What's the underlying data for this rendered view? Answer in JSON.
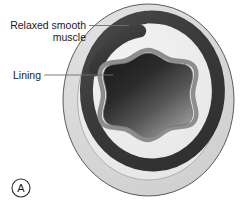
{
  "figure": {
    "panel_label": "A",
    "caption_subject": "relaxed smooth muscle vessel cross-section",
    "labels": [
      {
        "id": "relaxed-smooth-muscle",
        "line1": "Relaxed smooth",
        "line2": "muscle",
        "target": "muscle-ring"
      },
      {
        "id": "lining",
        "line1": "Lining",
        "line2": "",
        "target": "lining-wall"
      }
    ],
    "structures": [
      {
        "name": "outer-tissue-ring",
        "color": "#d6d6d6"
      },
      {
        "name": "inner-tissue-ring",
        "color": "#ededed"
      },
      {
        "name": "muscle-ring",
        "color": "#3b3b3b"
      },
      {
        "name": "lining-wall",
        "color": "#8d8d8d"
      },
      {
        "name": "lumen",
        "color": "#2e2e2e"
      }
    ],
    "colors": {
      "outline": "#4a4a4a",
      "outer_ring": "#d6d6d6",
      "inner_ring": "#ededed",
      "muscle": "#3b3b3b",
      "lining": "#8d8d8d",
      "lumen_dark": "#252525",
      "lumen_light": "#9a9a9a",
      "leader_line": "#6e6e6e",
      "text": "#1a1a1a",
      "background": "#ffffff"
    }
  }
}
